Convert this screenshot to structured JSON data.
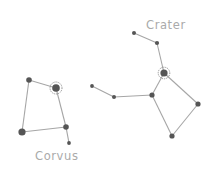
{
  "constellations": [
    {
      "name": "Corvus",
      "label_pos": [
        35,
        160
      ],
      "stars": [
        {
          "x": 29,
          "y": 80,
          "r": 2.8,
          "halo": false
        },
        {
          "x": 56,
          "y": 88,
          "r": 3.8,
          "halo": true
        },
        {
          "x": 66,
          "y": 127,
          "r": 2.8,
          "halo": false
        },
        {
          "x": 22,
          "y": 132,
          "r": 3.6,
          "halo": false
        },
        {
          "x": 69,
          "y": 143,
          "r": 1.9,
          "halo": false
        }
      ],
      "edges": [
        [
          0,
          1
        ],
        [
          1,
          2
        ],
        [
          2,
          3
        ],
        [
          3,
          0
        ],
        [
          2,
          4
        ]
      ]
    },
    {
      "name": "Crater",
      "label_pos": [
        146,
        29
      ],
      "stars": [
        {
          "x": 134,
          "y": 33,
          "r": 2.0,
          "halo": false
        },
        {
          "x": 157,
          "y": 43,
          "r": 2.1,
          "halo": false
        },
        {
          "x": 164,
          "y": 73,
          "r": 3.6,
          "halo": true
        },
        {
          "x": 152,
          "y": 95,
          "r": 2.6,
          "halo": false
        },
        {
          "x": 114,
          "y": 97,
          "r": 2.0,
          "halo": false
        },
        {
          "x": 92,
          "y": 86,
          "r": 1.9,
          "halo": false
        },
        {
          "x": 198,
          "y": 104,
          "r": 2.6,
          "halo": false
        },
        {
          "x": 172,
          "y": 136,
          "r": 2.6,
          "halo": false
        }
      ],
      "edges": [
        [
          0,
          1
        ],
        [
          1,
          2
        ],
        [
          2,
          3
        ],
        [
          3,
          4
        ],
        [
          4,
          5
        ],
        [
          2,
          6
        ],
        [
          6,
          7
        ],
        [
          7,
          3
        ]
      ]
    }
  ],
  "colors": {
    "line": "#a6a6a6",
    "star": "#555555",
    "label": "#aaaaaa"
  }
}
